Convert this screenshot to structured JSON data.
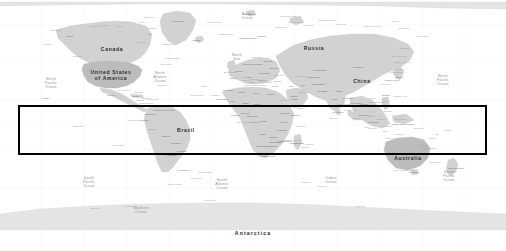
{
  "image": {
    "kind": "world-map-screenshot",
    "width": 506,
    "height": 251,
    "background_color": "#ffffff",
    "land_color": "#d2d2d2",
    "label_color": "#2b2b2b",
    "ocean_label_color": "#8e8e8e"
  },
  "annotation": {
    "shape": "rectangle",
    "color": "#000000",
    "border_width_px": 2,
    "x": 18,
    "y": 105,
    "width": 469,
    "height": 50,
    "label": ""
  },
  "country_labels": [
    {
      "text": "Canada",
      "x": 112,
      "y": 49,
      "size": "big"
    },
    {
      "text": "United   States",
      "x": 111,
      "y": 72,
      "size": "big"
    },
    {
      "text": "of  America",
      "x": 111,
      "y": 78,
      "size": "big"
    },
    {
      "text": "Russia",
      "x": 314,
      "y": 48,
      "size": "big"
    },
    {
      "text": "China",
      "x": 362,
      "y": 81,
      "size": "big"
    },
    {
      "text": "Brazil",
      "x": 186,
      "y": 130,
      "size": "big"
    },
    {
      "text": "Australia",
      "x": 408,
      "y": 158,
      "size": "big"
    },
    {
      "text": "Antarctica",
      "x": 253,
      "y": 233,
      "size": "antarctica"
    }
  ],
  "ocean_labels": [
    {
      "lines": [
        "North",
        "Pacific",
        "Ocean"
      ],
      "x": 51,
      "y": 83
    },
    {
      "lines": [
        "North",
        "Pacific",
        "Ocean"
      ],
      "x": 443,
      "y": 80
    },
    {
      "lines": [
        "North",
        "Atlantic",
        "Ocean"
      ],
      "x": 160,
      "y": 77
    },
    {
      "lines": [
        "South",
        "Pacific",
        "Ocean"
      ],
      "x": 89,
      "y": 182
    },
    {
      "lines": [
        "South",
        "Pacific",
        "Ocean"
      ],
      "x": 449,
      "y": 176
    },
    {
      "lines": [
        "South",
        "Atlantic",
        "Ocean"
      ],
      "x": 222,
      "y": 184
    },
    {
      "lines": [
        "Indian",
        "Ocean"
      ],
      "x": 331,
      "y": 180
    },
    {
      "lines": [
        "Arctic",
        "Ocean"
      ],
      "x": 247,
      "y": 16
    },
    {
      "lines": [
        "Southern",
        "Ocean"
      ],
      "x": 141,
      "y": 210
    },
    {
      "lines": [
        "North",
        "Sea"
      ],
      "x": 237,
      "y": 57
    }
  ],
  "region_labels": [
    {
      "text": "Greenland",
      "x": 178,
      "y": 21
    },
    {
      "text": "Iceland",
      "x": 196,
      "y": 40
    },
    {
      "text": "Alaska",
      "x": 69,
      "y": 36
    },
    {
      "text": "Norway",
      "x": 244,
      "y": 38
    },
    {
      "text": "Sweden",
      "x": 252,
      "y": 38
    },
    {
      "text": "Finland",
      "x": 261,
      "y": 36
    },
    {
      "text": "Kazakhstan",
      "x": 320,
      "y": 70
    },
    {
      "text": "Mongolia",
      "x": 358,
      "y": 67
    },
    {
      "text": "Japan",
      "x": 399,
      "y": 77
    },
    {
      "text": "India",
      "x": 334,
      "y": 99
    },
    {
      "text": "Iran",
      "x": 303,
      "y": 85
    },
    {
      "text": "Turkey",
      "x": 278,
      "y": 81
    },
    {
      "text": "Egypt",
      "x": 271,
      "y": 94
    },
    {
      "text": "Algeria",
      "x": 241,
      "y": 92
    },
    {
      "text": "Libya",
      "x": 256,
      "y": 93
    },
    {
      "text": "Sudan",
      "x": 271,
      "y": 105
    },
    {
      "text": "Chad",
      "x": 257,
      "y": 104
    },
    {
      "text": "Niger",
      "x": 246,
      "y": 103
    },
    {
      "text": "Mali",
      "x": 232,
      "y": 101
    },
    {
      "text": "Nigeria",
      "x": 245,
      "y": 113
    },
    {
      "text": "Ethiopia",
      "x": 285,
      "y": 113
    },
    {
      "text": "Kenya",
      "x": 283,
      "y": 122
    },
    {
      "text": "Tanzania",
      "x": 282,
      "y": 130
    },
    {
      "text": "Angola",
      "x": 262,
      "y": 134
    },
    {
      "text": "Zambia",
      "x": 273,
      "y": 137
    },
    {
      "text": "Namibia",
      "x": 261,
      "y": 146
    },
    {
      "text": "Botswana",
      "x": 271,
      "y": 146
    },
    {
      "text": "South Africa",
      "x": 268,
      "y": 156
    },
    {
      "text": "Madagascar",
      "x": 297,
      "y": 143
    },
    {
      "text": "Congo",
      "x": 263,
      "y": 121
    },
    {
      "text": "Mexico",
      "x": 111,
      "y": 95
    },
    {
      "text": "Cuba",
      "x": 136,
      "y": 96
    },
    {
      "text": "Venezuela",
      "x": 159,
      "y": 110
    },
    {
      "text": "Colombia",
      "x": 150,
      "y": 114
    },
    {
      "text": "Peru",
      "x": 152,
      "y": 129
    },
    {
      "text": "Bolivia",
      "x": 166,
      "y": 136
    },
    {
      "text": "Chile",
      "x": 160,
      "y": 154
    },
    {
      "text": "Argentina",
      "x": 171,
      "y": 155
    },
    {
      "text": "Paraguay",
      "x": 176,
      "y": 143
    },
    {
      "text": "Uruguay",
      "x": 182,
      "y": 151
    },
    {
      "text": "Ecuador",
      "x": 144,
      "y": 120
    },
    {
      "text": "Guyana",
      "x": 170,
      "y": 110
    },
    {
      "text": "Indonesia",
      "x": 373,
      "y": 122
    },
    {
      "text": "Philippines",
      "x": 388,
      "y": 106
    },
    {
      "text": "Thailand",
      "x": 356,
      "y": 103
    },
    {
      "text": "Vietnam",
      "x": 364,
      "y": 104
    },
    {
      "text": "Malaysia",
      "x": 364,
      "y": 115
    },
    {
      "text": "Pakistan",
      "x": 322,
      "y": 91
    },
    {
      "text": "Afghanistan",
      "x": 318,
      "y": 84
    },
    {
      "text": "Iraq",
      "x": 291,
      "y": 86
    },
    {
      "text": "Saudi",
      "x": 294,
      "y": 96
    },
    {
      "text": "Arabia",
      "x": 294,
      "y": 99
    },
    {
      "text": "Ukraine",
      "x": 274,
      "y": 68
    },
    {
      "text": "Poland",
      "x": 258,
      "y": 64
    },
    {
      "text": "Germany",
      "x": 248,
      "y": 64
    },
    {
      "text": "France",
      "x": 239,
      "y": 71
    },
    {
      "text": "Spain",
      "x": 233,
      "y": 78
    },
    {
      "text": "Italy",
      "x": 250,
      "y": 77
    },
    {
      "text": "New Zealand",
      "x": 456,
      "y": 168
    },
    {
      "text": "Papua New Guinea",
      "x": 403,
      "y": 124
    },
    {
      "text": "Myanmar",
      "x": 348,
      "y": 98
    },
    {
      "text": "Somalia",
      "x": 295,
      "y": 115
    },
    {
      "text": "Morocco",
      "x": 228,
      "y": 90
    },
    {
      "text": "Mauritania",
      "x": 222,
      "y": 99
    },
    {
      "text": "Uzbekistan",
      "x": 314,
      "y": 77
    },
    {
      "text": "Zimbabwe",
      "x": 276,
      "y": 142
    },
    {
      "text": "Mozambique",
      "x": 285,
      "y": 141
    },
    {
      "text": "Ghana",
      "x": 235,
      "y": 115
    },
    {
      "text": "Cameroon",
      "x": 252,
      "y": 116
    },
    {
      "text": "Gabon",
      "x": 254,
      "y": 122
    },
    {
      "text": "Belarus",
      "x": 268,
      "y": 61
    },
    {
      "text": "Romania",
      "x": 264,
      "y": 73
    },
    {
      "text": "Greece",
      "x": 262,
      "y": 80
    },
    {
      "text": "Nepal",
      "x": 339,
      "y": 91
    },
    {
      "text": "Sri Lanka",
      "x": 338,
      "y": 112
    },
    {
      "text": "Taiwan",
      "x": 386,
      "y": 95
    },
    {
      "text": "South Korea",
      "x": 392,
      "y": 80
    },
    {
      "text": "Tasmania",
      "x": 414,
      "y": 172
    },
    {
      "text": "Fiji",
      "x": 437,
      "y": 134
    },
    {
      "text": "Hawaii",
      "x": 45,
      "y": 98
    },
    {
      "text": "Svalbard",
      "x": 250,
      "y": 14
    },
    {
      "text": "Falkland Is.",
      "x": 184,
      "y": 170
    }
  ],
  "micro_labels": [
    {
      "text": "Baffin Bay",
      "x": 152,
      "y": 28
    },
    {
      "text": "Hudson Bay",
      "x": 140,
      "y": 42
    },
    {
      "text": "Labrador Sea",
      "x": 168,
      "y": 44
    },
    {
      "text": "Bering Sea",
      "x": 56,
      "y": 30
    },
    {
      "text": "Gulf of Mexico",
      "x": 124,
      "y": 90
    },
    {
      "text": "Caribbean Sea",
      "x": 146,
      "y": 103
    },
    {
      "text": "Mediterranean Sea",
      "x": 253,
      "y": 85
    },
    {
      "text": "Black Sea",
      "x": 279,
      "y": 75
    },
    {
      "text": "Red Sea",
      "x": 284,
      "y": 100
    },
    {
      "text": "Caspian Sea",
      "x": 301,
      "y": 76
    },
    {
      "text": "Arabian Sea",
      "x": 318,
      "y": 105
    },
    {
      "text": "Bay of Bengal",
      "x": 344,
      "y": 104
    },
    {
      "text": "South China Sea",
      "x": 376,
      "y": 102
    },
    {
      "text": "Sea of Japan",
      "x": 396,
      "y": 72
    },
    {
      "text": "Coral Sea",
      "x": 424,
      "y": 145
    },
    {
      "text": "Tasman Sea",
      "x": 435,
      "y": 162
    },
    {
      "text": "Barents Sea",
      "x": 281,
      "y": 27
    },
    {
      "text": "Kara Sea",
      "x": 309,
      "y": 25
    },
    {
      "text": "Laptev Sea",
      "x": 341,
      "y": 24
    },
    {
      "text": "East Siberian Sea",
      "x": 373,
      "y": 26
    },
    {
      "text": "Chukchi Sea",
      "x": 404,
      "y": 28
    },
    {
      "text": "Beaufort Sea",
      "x": 96,
      "y": 26
    },
    {
      "text": "Greenland Sea",
      "x": 214,
      "y": 22
    },
    {
      "text": "Norwegian Sea",
      "x": 226,
      "y": 34
    },
    {
      "text": "Philippine Sea",
      "x": 400,
      "y": 96
    },
    {
      "text": "Drake Passage",
      "x": 175,
      "y": 184
    },
    {
      "text": "Weddell Sea",
      "x": 210,
      "y": 200
    },
    {
      "text": "Ross Sea",
      "x": 95,
      "y": 208
    },
    {
      "text": "Scotia Sea",
      "x": 196,
      "y": 178
    },
    {
      "text": "Davis Sea",
      "x": 360,
      "y": 206
    },
    {
      "text": "Amundsen Sea",
      "x": 130,
      "y": 206
    },
    {
      "text": "Java Sea",
      "x": 372,
      "y": 128
    },
    {
      "text": "Banda Sea",
      "x": 387,
      "y": 126
    },
    {
      "text": "Timor Sea",
      "x": 390,
      "y": 138
    },
    {
      "text": "Arafura Sea",
      "x": 399,
      "y": 134
    },
    {
      "text": "Great Australian Bight",
      "x": 404,
      "y": 170
    },
    {
      "text": "Gulf of Guinea",
      "x": 243,
      "y": 122
    },
    {
      "text": "Mozambique Channel",
      "x": 291,
      "y": 140
    },
    {
      "text": "Bering Strait",
      "x": 423,
      "y": 36
    },
    {
      "text": "Sea of Okhotsk",
      "x": 399,
      "y": 56
    },
    {
      "text": "Yellow Sea",
      "x": 385,
      "y": 84
    },
    {
      "text": "Andaman Sea",
      "x": 350,
      "y": 110
    },
    {
      "text": "Persian Gulf",
      "x": 304,
      "y": 92
    },
    {
      "text": "Gulf of Aden",
      "x": 295,
      "y": 106
    },
    {
      "text": "Baltic Sea",
      "x": 257,
      "y": 57
    },
    {
      "text": "Bay of Biscay",
      "x": 230,
      "y": 72
    },
    {
      "text": "Adriatic Sea",
      "x": 254,
      "y": 79
    },
    {
      "text": "Aegean Sea",
      "x": 266,
      "y": 82
    },
    {
      "text": "North Atlantic",
      "x": 197,
      "y": 95
    },
    {
      "text": "Azores",
      "x": 204,
      "y": 86
    },
    {
      "text": "Canary Is.",
      "x": 216,
      "y": 95
    },
    {
      "text": "Cape Verde",
      "x": 208,
      "y": 105
    },
    {
      "text": "Galapagos",
      "x": 133,
      "y": 120
    },
    {
      "text": "Easter Island",
      "x": 118,
      "y": 145
    },
    {
      "text": "Marquesas",
      "x": 78,
      "y": 126
    },
    {
      "text": "Samoa",
      "x": 448,
      "y": 130
    },
    {
      "text": "Solomon Is.",
      "x": 419,
      "y": 128
    },
    {
      "text": "New Caledonia",
      "x": 430,
      "y": 148
    },
    {
      "text": "Vanuatu",
      "x": 432,
      "y": 138
    },
    {
      "text": "Kerguelen",
      "x": 322,
      "y": 186
    },
    {
      "text": "South Georgia",
      "x": 205,
      "y": 172
    },
    {
      "text": "Crozet Is.",
      "x": 306,
      "y": 182
    },
    {
      "text": "Reunion",
      "x": 305,
      "y": 147
    },
    {
      "text": "Mauritius",
      "x": 309,
      "y": 144
    },
    {
      "text": "Seychelles",
      "x": 301,
      "y": 126
    },
    {
      "text": "Maldives",
      "x": 333,
      "y": 118
    },
    {
      "text": "Socotra",
      "x": 301,
      "y": 108
    },
    {
      "text": "Cyprus",
      "x": 275,
      "y": 86
    },
    {
      "text": "Crete",
      "x": 264,
      "y": 85
    },
    {
      "text": "Sicily",
      "x": 252,
      "y": 82
    },
    {
      "text": "Sardinia",
      "x": 246,
      "y": 80
    },
    {
      "text": "Corsica",
      "x": 245,
      "y": 77
    },
    {
      "text": "Bahamas",
      "x": 139,
      "y": 92
    },
    {
      "text": "Jamaica",
      "x": 140,
      "y": 100
    },
    {
      "text": "Hispaniola",
      "x": 146,
      "y": 98
    },
    {
      "text": "Puerto Rico",
      "x": 153,
      "y": 99
    },
    {
      "text": "Trinidad",
      "x": 160,
      "y": 106
    },
    {
      "text": "Bermuda",
      "x": 162,
      "y": 85
    },
    {
      "text": "Newfoundland",
      "x": 172,
      "y": 58
    },
    {
      "text": "Nova Scotia",
      "x": 166,
      "y": 64
    },
    {
      "text": "Vancouver",
      "x": 77,
      "y": 56
    },
    {
      "text": "Aleutian Is.",
      "x": 47,
      "y": 44
    },
    {
      "text": "Kamchatka",
      "x": 405,
      "y": 48
    },
    {
      "text": "Sakhalin",
      "x": 398,
      "y": 62
    },
    {
      "text": "Kuril Is.",
      "x": 407,
      "y": 62
    },
    {
      "text": "Hokkaido",
      "x": 400,
      "y": 69
    },
    {
      "text": "Borneo",
      "x": 372,
      "y": 116
    },
    {
      "text": "Sumatra",
      "x": 356,
      "y": 118
    },
    {
      "text": "Java",
      "x": 367,
      "y": 127
    },
    {
      "text": "Sulawesi",
      "x": 381,
      "y": 119
    },
    {
      "text": "New Guinea",
      "x": 400,
      "y": 119
    },
    {
      "text": "Timor",
      "x": 385,
      "y": 131
    },
    {
      "text": "Luzon",
      "x": 386,
      "y": 101
    },
    {
      "text": "Mindanao",
      "x": 388,
      "y": 111
    },
    {
      "text": "Hainan",
      "x": 372,
      "y": 98
    },
    {
      "text": "Novaya Zemlya",
      "x": 296,
      "y": 22
    },
    {
      "text": "Severnaya Zemlya",
      "x": 327,
      "y": 20
    },
    {
      "text": "Franz Josef Land",
      "x": 288,
      "y": 16
    },
    {
      "text": "Wrangel I.",
      "x": 396,
      "y": 21
    },
    {
      "text": "Victoria I.",
      "x": 120,
      "y": 26
    },
    {
      "text": "Ellesmere I.",
      "x": 150,
      "y": 17
    },
    {
      "text": "Banks I.",
      "x": 106,
      "y": 25
    },
    {
      "text": "Devon I.",
      "x": 143,
      "y": 22
    },
    {
      "text": "Baffin I.",
      "x": 150,
      "y": 34
    }
  ],
  "graticule": {
    "visible": true,
    "color": "#e8e8e8",
    "lon_step_deg": 30,
    "lat_step_deg": 30
  }
}
